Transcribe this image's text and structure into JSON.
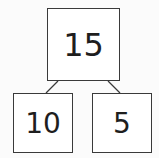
{
  "diagram": {
    "type": "number-bond",
    "whole": {
      "value": "15"
    },
    "parts": [
      {
        "value": "10"
      },
      {
        "value": "5"
      }
    ]
  }
}
